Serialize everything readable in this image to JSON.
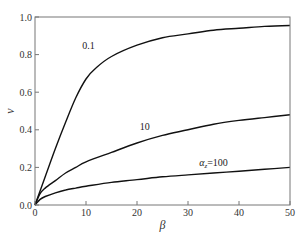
{
  "chart_data": {
    "type": "line",
    "title": "",
    "xlabel": "β",
    "ylabel": "ν",
    "xlim": [
      0,
      50
    ],
    "ylim": [
      0.0,
      1.0
    ],
    "xticks": [
      0,
      10,
      20,
      30,
      40,
      50
    ],
    "xtick_labels": [
      "0",
      "10",
      "20",
      "30",
      "40",
      "50"
    ],
    "yticks": [
      0.0,
      0.2,
      0.4,
      0.6,
      0.8,
      1.0
    ],
    "ytick_labels": [
      "0.0",
      "0.2",
      "0.4",
      "0.6",
      "0.8",
      "1.0"
    ],
    "grid": false,
    "legend": "none",
    "series": [
      {
        "name": "0.1",
        "label": "0.1",
        "x": [
          0,
          2,
          4,
          6,
          8,
          10,
          12,
          15,
          20,
          25,
          30,
          35,
          40,
          45,
          50
        ],
        "y": [
          0.0,
          0.15,
          0.3,
          0.44,
          0.57,
          0.67,
          0.73,
          0.79,
          0.85,
          0.89,
          0.91,
          0.93,
          0.94,
          0.95,
          0.955
        ],
        "label_at": [
          10.5,
          0.83
        ]
      },
      {
        "name": "10",
        "label": "10",
        "x": [
          0,
          1,
          2,
          4,
          6,
          8,
          10,
          15,
          20,
          25,
          30,
          35,
          40,
          45,
          50
        ],
        "y": [
          0.0,
          0.06,
          0.09,
          0.13,
          0.17,
          0.2,
          0.23,
          0.28,
          0.33,
          0.37,
          0.4,
          0.43,
          0.45,
          0.465,
          0.48
        ],
        "label_at": [
          21.5,
          0.4
        ]
      },
      {
        "name": "α_z=100",
        "label": "α_z=100",
        "x": [
          0,
          1,
          2,
          4,
          6,
          8,
          10,
          15,
          20,
          25,
          30,
          35,
          40,
          45,
          50
        ],
        "y": [
          0.0,
          0.03,
          0.045,
          0.065,
          0.08,
          0.09,
          0.1,
          0.12,
          0.135,
          0.15,
          0.16,
          0.17,
          0.18,
          0.19,
          0.2
        ],
        "label_at": [
          35,
          0.21
        ]
      }
    ]
  }
}
